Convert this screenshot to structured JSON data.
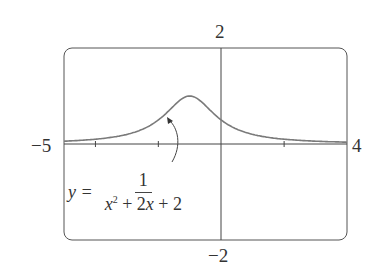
{
  "chart_data": {
    "type": "line",
    "title": "",
    "function": "y = 1/(x^2 + 2x + 2)",
    "xlim": [
      -5,
      4
    ],
    "ylim": [
      -2,
      2
    ],
    "x_tick_spacing": 2,
    "x_ticks": [
      -4,
      -2,
      0,
      2
    ],
    "labels": {
      "xmin": "−5",
      "xmax": "4",
      "ymax": "2",
      "ymin": "−2"
    },
    "annotation": {
      "lhs": "y =",
      "numerator": "1",
      "denominator_terms": [
        "x",
        "2",
        " + 2",
        "x",
        " + 2"
      ],
      "points_to": [
        -1.5,
        0.8
      ]
    },
    "series": [
      {
        "name": "y = 1/(x^2+2x+2)",
        "x": [
          -5,
          -4,
          -3,
          -2.5,
          -2,
          -1.5,
          -1,
          -0.5,
          0,
          0.5,
          1,
          2,
          3,
          4
        ],
        "values": [
          0.059,
          0.1,
          0.2,
          0.308,
          0.5,
          0.8,
          1.0,
          0.8,
          0.5,
          0.308,
          0.2,
          0.1,
          0.059,
          0.038
        ]
      }
    ],
    "grid": false,
    "line_color": "#7a7a7a"
  }
}
